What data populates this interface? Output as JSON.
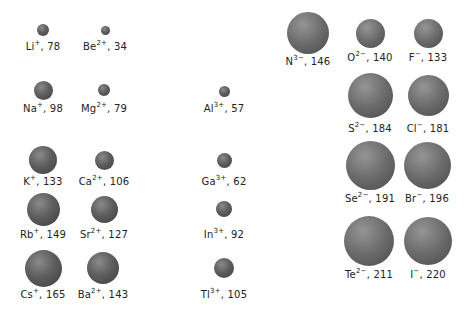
{
  "ions": [
    {
      "id": "li",
      "symbol": "Li",
      "charge": "+",
      "radius": "78",
      "cx": 43,
      "cy": 30,
      "d": 12,
      "ly": 41,
      "anion": false
    },
    {
      "id": "be",
      "symbol": "Be",
      "charge": "2+",
      "radius": "34",
      "cx": 105,
      "cy": 30,
      "d": 9,
      "ly": 41,
      "anion": false
    },
    {
      "id": "na",
      "symbol": "Na",
      "charge": "+",
      "radius": "98",
      "cx": 43,
      "cy": 90,
      "d": 19,
      "ly": 103,
      "anion": false
    },
    {
      "id": "mg",
      "symbol": "Mg",
      "charge": "2+",
      "radius": "79",
      "cx": 104,
      "cy": 90,
      "d": 12,
      "ly": 103,
      "anion": false
    },
    {
      "id": "al",
      "symbol": "Al",
      "charge": "3+",
      "radius": "57",
      "cx": 224,
      "cy": 91,
      "d": 11,
      "ly": 103,
      "anion": false
    },
    {
      "id": "k",
      "symbol": "K",
      "charge": "+",
      "radius": "133",
      "cx": 43,
      "cy": 160,
      "d": 28,
      "ly": 176,
      "anion": false
    },
    {
      "id": "ca",
      "symbol": "Ca",
      "charge": "2+",
      "radius": "106",
      "cx": 104,
      "cy": 160,
      "d": 19,
      "ly": 176,
      "anion": false
    },
    {
      "id": "ga",
      "symbol": "Ga",
      "charge": "3+",
      "radius": "62",
      "cx": 224,
      "cy": 160,
      "d": 15,
      "ly": 176,
      "anion": false
    },
    {
      "id": "rb",
      "symbol": "Rb",
      "charge": "+",
      "radius": "149",
      "cx": 43,
      "cy": 209,
      "d": 33,
      "ly": 229,
      "anion": false
    },
    {
      "id": "sr",
      "symbol": "Sr",
      "charge": "2+",
      "radius": "127",
      "cx": 104,
      "cy": 209,
      "d": 27,
      "ly": 229,
      "anion": false
    },
    {
      "id": "in",
      "symbol": "In",
      "charge": "3+",
      "radius": "92",
      "cx": 224,
      "cy": 209,
      "d": 16,
      "ly": 229,
      "anion": false
    },
    {
      "id": "cs",
      "symbol": "Cs",
      "charge": "+",
      "radius": "165",
      "cx": 43,
      "cy": 268,
      "d": 37,
      "ly": 289,
      "anion": false
    },
    {
      "id": "ba",
      "symbol": "Ba",
      "charge": "2+",
      "radius": "143",
      "cx": 103,
      "cy": 268,
      "d": 32,
      "ly": 289,
      "anion": false
    },
    {
      "id": "tl",
      "symbol": "Tl",
      "charge": "3+",
      "radius": "105",
      "cx": 224,
      "cy": 268,
      "d": 20,
      "ly": 289,
      "anion": false
    },
    {
      "id": "n",
      "symbol": "N",
      "charge": "3−",
      "radius": "146",
      "cx": 308,
      "cy": 33,
      "d": 42,
      "ly": 56,
      "anion": true
    },
    {
      "id": "o",
      "symbol": "O",
      "charge": "2−",
      "radius": "140",
      "cx": 370,
      "cy": 33,
      "d": 29,
      "ly": 52,
      "anion": true
    },
    {
      "id": "f",
      "symbol": "F",
      "charge": "−",
      "radius": "133",
      "cx": 428,
      "cy": 33,
      "d": 29,
      "ly": 52,
      "anion": true
    },
    {
      "id": "s",
      "symbol": "S",
      "charge": "2−",
      "radius": "184",
      "cx": 370,
      "cy": 95,
      "d": 45,
      "ly": 123,
      "anion": true
    },
    {
      "id": "cl",
      "symbol": "Cl",
      "charge": "−",
      "radius": "181",
      "cx": 428,
      "cy": 95,
      "d": 41,
      "ly": 123,
      "anion": true
    },
    {
      "id": "se",
      "symbol": "Se",
      "charge": "2−",
      "radius": "191",
      "cx": 370,
      "cy": 165,
      "d": 49,
      "ly": 193,
      "anion": true
    },
    {
      "id": "br",
      "symbol": "Br",
      "charge": "−",
      "radius": "196",
      "cx": 427,
      "cy": 165,
      "d": 47,
      "ly": 193,
      "anion": true
    },
    {
      "id": "te",
      "symbol": "Te",
      "charge": "2−",
      "radius": "211",
      "cx": 369,
      "cy": 241,
      "d": 50,
      "ly": 269,
      "anion": true
    },
    {
      "id": "i",
      "symbol": "I",
      "charge": "−",
      "radius": "220",
      "cx": 428,
      "cy": 241,
      "d": 48,
      "ly": 269,
      "anion": true
    }
  ]
}
